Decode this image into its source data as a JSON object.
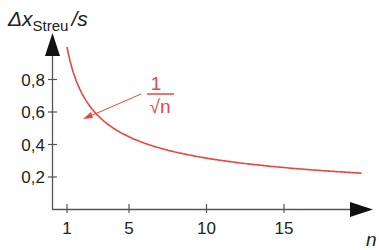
{
  "chart_data": {
    "type": "line",
    "title": "",
    "ylabel_main": "Δx",
    "ylabel_sub": "Streu",
    "ylabel_unit": "/s",
    "xlabel": "n",
    "x_ticks": [
      1,
      5,
      10,
      15
    ],
    "y_ticks": [
      "0,2",
      "0,4",
      "0,6",
      "0,8"
    ],
    "y_tick_values": [
      0.2,
      0.4,
      0.6,
      0.8
    ],
    "xlim": [
      0,
      20.5
    ],
    "ylim": [
      0,
      1.0
    ],
    "grid": false,
    "series": [
      {
        "name": "1/√n",
        "color": "#e8473c",
        "formula": "1/sqrt(n)",
        "x": [
          1,
          2,
          3,
          4,
          5,
          6,
          7,
          8,
          9,
          10,
          11,
          12,
          13,
          14,
          15,
          16,
          17,
          18,
          19,
          20
        ],
        "values": [
          1.0,
          0.71,
          0.58,
          0.5,
          0.45,
          0.41,
          0.38,
          0.35,
          0.33,
          0.32,
          0.3,
          0.29,
          0.28,
          0.27,
          0.26,
          0.25,
          0.24,
          0.24,
          0.23,
          0.22
        ]
      }
    ],
    "annotation": {
      "numerator": "1",
      "denominator": "√n",
      "color": "#e8473c",
      "points_to_n": 5
    }
  }
}
